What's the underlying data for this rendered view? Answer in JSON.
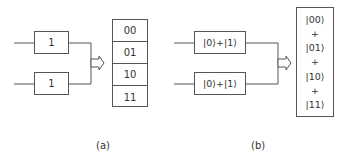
{
  "panel_a": {
    "label": "(a)",
    "inputs": [
      "1",
      "1"
    ],
    "outputs": [
      "00",
      "01",
      "10",
      "11"
    ]
  },
  "panel_b": {
    "label": "(b)",
    "inputs": [
      "|0⟩+|1⟩",
      "|0⟩+|1⟩"
    ],
    "outputs": [
      "|00⟩",
      "+",
      "|01⟩",
      "+",
      "|10⟩",
      "+",
      "|11⟩"
    ]
  },
  "colors": {
    "line": "#555555",
    "text": "#333333",
    "background": "#ffffff"
  }
}
